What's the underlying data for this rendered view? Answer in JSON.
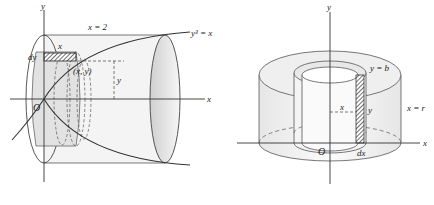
{
  "figures": [
    {
      "id": "left",
      "description": "Solid of revolution about the x-axis using cylindrical shells",
      "labels": {
        "y_axis": "y",
        "x_axis": "x",
        "origin": "O",
        "boundary": "x = 2",
        "curve": "y³ = x",
        "shell_thickness": "dy",
        "shell_length": "x",
        "point": "(x, y)",
        "height": "y"
      }
    },
    {
      "id": "right",
      "description": "Cylindrical shell method, rotation about the y-axis",
      "labels": {
        "y_axis": "y",
        "x_axis": "x",
        "origin": "O",
        "top": "y = b",
        "outer_radius": "x = r",
        "radius": "x",
        "height": "y",
        "thickness": "dx"
      }
    }
  ],
  "colors": {
    "line": "#333333",
    "shade": "#e4e4e4",
    "hatch": "#444444"
  }
}
